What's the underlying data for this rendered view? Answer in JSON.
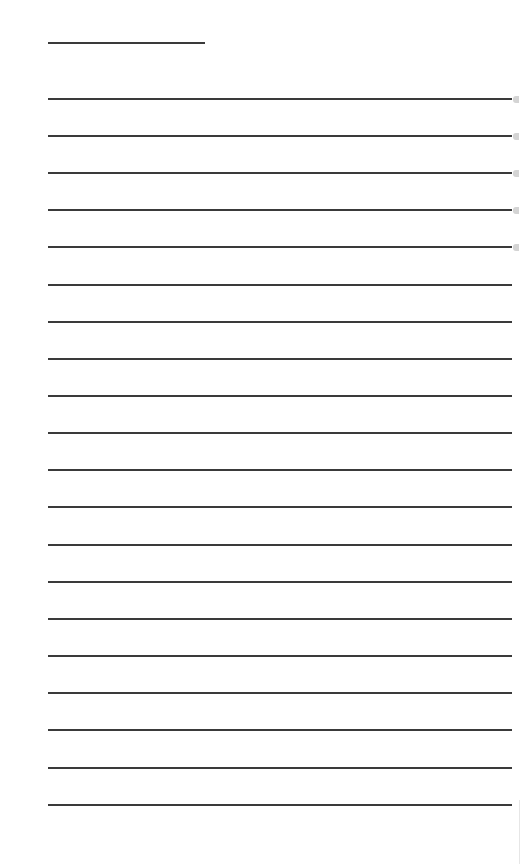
{
  "page": {
    "type": "lined-notepad",
    "background_color": "#ffffff",
    "line_color": "#3a3a3a",
    "title_line": {
      "x": 48,
      "y": 42,
      "width": 157
    },
    "rules": {
      "x": 48,
      "width": 464,
      "y_positions": [
        99,
        136,
        173,
        210,
        247,
        285,
        322,
        359,
        396,
        433,
        470,
        507,
        545,
        582,
        619,
        656,
        693,
        730,
        768,
        805
      ]
    },
    "right_tab_marks_y": [
      99,
      136,
      173,
      210,
      247
    ]
  }
}
